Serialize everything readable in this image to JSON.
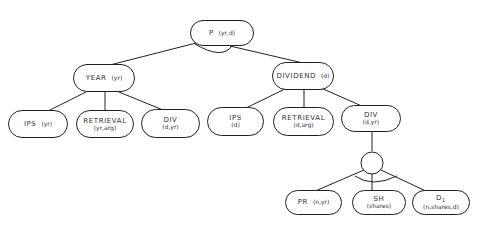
{
  "diagram": {
    "type": "and-or tree",
    "nodes": {
      "root": {
        "label": "P",
        "args": "(yr,d)"
      },
      "year": {
        "label": "YEAR",
        "args": "(yr)"
      },
      "dividend": {
        "label": "DIVIDEND",
        "args": "(d)"
      },
      "year_ips": {
        "label": "IPS",
        "args": "(yr)"
      },
      "year_retrieval": {
        "label": "RETRIEVAL",
        "args": "(yr,arg)"
      },
      "year_div": {
        "label": "DIV",
        "args": "(d,yr)"
      },
      "div_ips": {
        "label": "IPS",
        "args": "(d)"
      },
      "div_retrieval": {
        "label": "RETRIEVAL",
        "args": "(d,arg)"
      },
      "div_div": {
        "label": "DIV",
        "args": "(d,yr)"
      },
      "pr": {
        "label": "PR",
        "args": "(n,yr)"
      },
      "sh": {
        "label": "SH",
        "args": "(shares)"
      },
      "d1": {
        "label": "D",
        "subscript": "1",
        "args": "(n,shares,d)"
      }
    },
    "edges": [
      [
        "root",
        "year"
      ],
      [
        "root",
        "dividend"
      ],
      [
        "year",
        "year_ips"
      ],
      [
        "year",
        "year_retrieval"
      ],
      [
        "year",
        "year_div"
      ],
      [
        "dividend",
        "div_ips"
      ],
      [
        "dividend",
        "div_retrieval"
      ],
      [
        "dividend",
        "div_div"
      ],
      [
        "div_div",
        "and_circle"
      ],
      [
        "and_circle",
        "pr"
      ],
      [
        "and_circle",
        "sh"
      ],
      [
        "and_circle",
        "d1"
      ]
    ],
    "connector_arcs": [
      "root-and-arc",
      "and-circle-arc"
    ]
  }
}
